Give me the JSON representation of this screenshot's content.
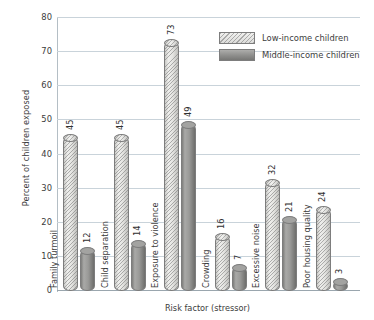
{
  "chart_data": {
    "type": "bar",
    "title": "",
    "xlabel": "Risk factor (stressor)",
    "ylabel": "Percent of children exposed",
    "categories": [
      "Family turmoil",
      "Child separation",
      "Exposure to violence",
      "Crowding",
      "Excessive noise",
      "Poor housing quality"
    ],
    "series": [
      {
        "name": "Low-income children",
        "values": [
          45,
          45,
          73,
          16,
          32,
          24
        ],
        "color": "#e2e2e0",
        "pattern": "diagonal-hatch"
      },
      {
        "name": "Middle-income children",
        "values": [
          12,
          14,
          49,
          7,
          21,
          3
        ],
        "color": "#9a9a98",
        "pattern": "solid"
      }
    ],
    "ylim": [
      0,
      80
    ],
    "yticks": [
      0,
      10,
      20,
      30,
      40,
      50,
      60,
      70,
      80
    ],
    "ytick_labels": [
      "0",
      "10",
      "20",
      "30",
      "40",
      "50",
      "60",
      "70",
      "80"
    ],
    "grid": true,
    "legend_position": "top-right"
  }
}
